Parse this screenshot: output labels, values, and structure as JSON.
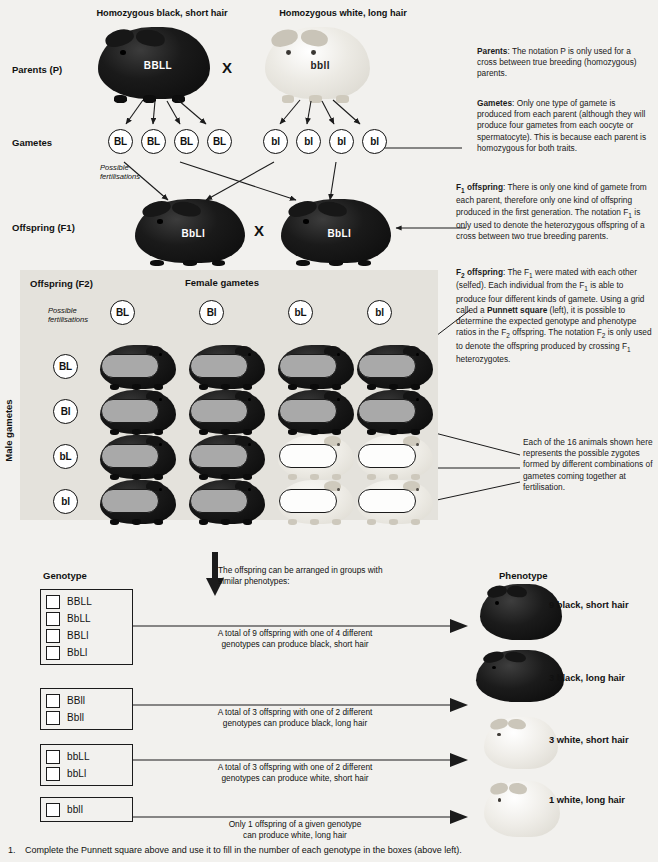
{
  "headers": {
    "parent_left": "Homozygous black, short hair",
    "parent_right": "Homozygous white, long hair"
  },
  "rows": {
    "parents": "Parents (P)",
    "gametes": "Gametes",
    "f1": "Offspring (F1)",
    "f2": "Offspring (F2)"
  },
  "cross_symbol": "X",
  "parents": {
    "left_genotype": "BBLL",
    "right_genotype": "bbll"
  },
  "parent_gametes": {
    "left": [
      "BL",
      "BL",
      "BL",
      "BL"
    ],
    "right": [
      "bl",
      "bl",
      "bl",
      "bl"
    ]
  },
  "possible_fert_1": "Possible\nfertilisations",
  "f1": {
    "left_genotype": "BbLl",
    "right_genotype": "BbLl"
  },
  "punnett": {
    "female_label": "Female gametes",
    "male_label": "Male gametes",
    "possible_fert": "Possible\nfertilisations",
    "columns": [
      "BL",
      "Bl",
      "bL",
      "bl"
    ],
    "rows": [
      "BL",
      "Bl",
      "bL",
      "bl"
    ],
    "cells": [
      [
        {
          "g": "BBLL",
          "c": "black"
        },
        {
          "g": "BBLl",
          "c": "black"
        },
        {
          "g": "BbLL",
          "c": "black"
        },
        {
          "g": "BbLl",
          "c": "black"
        }
      ],
      [
        {
          "g": "BBLl",
          "c": "black"
        },
        {
          "g": "BBll",
          "c": "black"
        },
        {
          "g": "BbLl",
          "c": "black"
        },
        {
          "g": "Bbll",
          "c": "black"
        }
      ],
      [
        {
          "g": "BbLL",
          "c": "black"
        },
        {
          "g": "BbLl",
          "c": "black"
        },
        {
          "g": "bbLL",
          "c": "white"
        },
        {
          "g": "bbLl",
          "c": "white"
        }
      ],
      [
        {
          "g": "BbLl",
          "c": "black"
        },
        {
          "g": "Bbll",
          "c": "black"
        },
        {
          "g": "bbLl",
          "c": "white"
        },
        {
          "g": "bbll",
          "c": "white"
        }
      ]
    ]
  },
  "notes": {
    "parents_title": "Parents",
    "parents_text": ": The notation P is only used for a cross between true breeding (homozygous) parents.",
    "gametes_title": "Gametes",
    "gametes_text": ": Only one type of gamete is produced from each parent (although they will produce four gametes from each oocyte or spermatocyte). This is because each parent is homozygous for both traits.",
    "f1_title": "F",
    "f1_title_sub": "1",
    "f1_title_rest": " offspring",
    "f1_text_a": ": There is only one kind of gamete from each parent, therefore only one kind of offspring produced in the first generation. The notation F",
    "f1_text_b": " is only used to denote the heterozygous offspring of a cross between two true breeding parents.",
    "f2_title": "F",
    "f2_title_sub": "2",
    "f2_title_rest": " offspring",
    "f2_text_a": ": The F",
    "f2_text_b": " were mated with each other (selfed). Each individual from the F",
    "f2_text_c": " is able to produce four different kinds of gamete. Using a grid called a ",
    "f2_bold": "Punnett square",
    "f2_text_d": " (left), it is possible to determine the expected genotype and phenotype ratios in the F",
    "f2_text_e": " offspring. The notation F",
    "f2_text_f": " is only used to denote the offspring produced by crossing F",
    "f2_text_g": " heterozygotes.",
    "zygote_note": "Each of the 16 animals shown here represents the possible zygotes formed by different combinations of gametes coming together at fertilisation."
  },
  "bottom": {
    "genotype_header": "Genotype",
    "phenotype_header": "Phenotype",
    "arrange_note": "The offspring can be arranged in groups with similar phenotypes:",
    "groups": [
      {
        "genotypes": [
          "BBLL",
          "BbLL",
          "BBLl",
          "BbLl"
        ],
        "description": "A total of 9 offspring with one of 4 different\ngenotypes can produce black, short hair",
        "phenotype_label": "9  black, short hair",
        "color": "black"
      },
      {
        "genotypes": [
          "BBll",
          "Bbll"
        ],
        "description": "A total of 3 offspring with one of 2 different\ngenotypes can produce black, long hair",
        "phenotype_label": "3  black, long hair",
        "color": "black"
      },
      {
        "genotypes": [
          "bbLL",
          "bbLl"
        ],
        "description": "A total of 3 offspring with one of 2 different\ngenotypes can produce white, short hair",
        "phenotype_label": "3  white, short hair",
        "color": "white"
      },
      {
        "genotypes": [
          "bbll"
        ],
        "description": "Only 1 offspring of a given genotype\ncan produce white, long hair",
        "phenotype_label": "1  white, long hair",
        "color": "white"
      }
    ]
  },
  "footer": {
    "number": "1.",
    "text": "Complete the Punnett square above and use it to fill in the number of each genotype in the boxes (above left)."
  },
  "colors": {
    "page_bg": "#f2f1ee",
    "panel_bg": "#e4e2dc",
    "ink": "#1b1b1b",
    "slot_gray": "#a9a9a9"
  }
}
